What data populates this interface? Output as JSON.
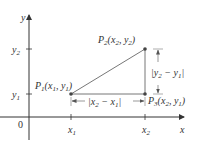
{
  "diagram": {
    "type": "coordinate-plane-distance",
    "axes": {
      "x_label": "x",
      "y_label": "y",
      "origin_label": "0",
      "x_ticks": [
        {
          "base": "x",
          "sub": "1"
        },
        {
          "base": "x",
          "sub": "2"
        }
      ],
      "y_ticks": [
        {
          "base": "y",
          "sub": "1"
        },
        {
          "base": "y",
          "sub": "2"
        }
      ]
    },
    "points": {
      "p1": {
        "name": "P",
        "sub": "1",
        "coords": "(x1, y1)",
        "x": "x",
        "xs": "1",
        "y": "y",
        "ys": "1"
      },
      "p2": {
        "name": "P",
        "sub": "2",
        "coords": "(x2, y2)",
        "x": "x",
        "xs": "2",
        "y": "y",
        "ys": "2"
      },
      "p3": {
        "name": "P",
        "sub": "3",
        "coords": "(x2, y1)",
        "x": "x",
        "xs": "2",
        "y": "y",
        "ys": "1"
      }
    },
    "measures": {
      "horizontal": {
        "text": "|x2 − x1|",
        "a": "x",
        "as": "2",
        "b": "x",
        "bs": "1",
        "minus": " − "
      },
      "vertical": {
        "text": "|y2 − y1|",
        "a": "y",
        "as": "2",
        "b": "y",
        "bs": "1",
        "minus": " − "
      }
    },
    "colors": {
      "axis": "#333333",
      "line": "#777777",
      "point": "#444444",
      "text": "#333333"
    }
  }
}
